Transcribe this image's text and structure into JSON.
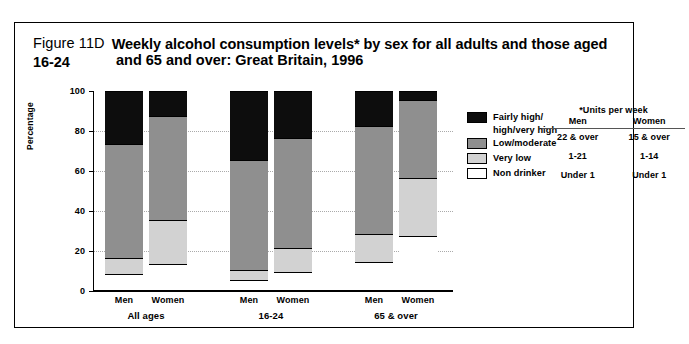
{
  "figure": {
    "number": "Figure 11D",
    "title_line1": "Weekly alcohol consumption levels* by sex for all adults and those aged 16-24",
    "title_line2": "and 65 and over: Great Britain, 1996"
  },
  "legend": {
    "items": [
      {
        "label": "Fairly high/",
        "label2": "high/very high",
        "color": "#0d0d0d",
        "key": "fairly-high"
      },
      {
        "label": "Low/moderate",
        "color": "#8f8f8f",
        "key": "low-moderate"
      },
      {
        "label": "Very low",
        "color": "#d2d2d2",
        "key": "very-low"
      },
      {
        "label": "Non drinker",
        "color": "#ffffff",
        "key": "non-drinker"
      }
    ],
    "units_table": {
      "title": "*Units per week",
      "columns": [
        "Men",
        "Women"
      ],
      "rows": [
        {
          "men": "22 & over",
          "women": "15 & over"
        },
        {
          "men": "1-21",
          "women": "1-14"
        },
        {
          "men": "Under 1",
          "women": "Under 1"
        }
      ]
    }
  },
  "chart_data": {
    "type": "bar",
    "title": "Weekly alcohol consumption levels* by sex for all adults and those aged 16-24 and 65 and over: Great Britain, 1996",
    "xlabel": "",
    "ylabel": "Percentage",
    "ylim": [
      0,
      100
    ],
    "yticks": [
      0,
      20,
      40,
      60,
      80,
      100
    ],
    "grid": true,
    "stacked": true,
    "legend_position": "right",
    "groups": [
      "All ages",
      "16-24",
      "65 & over"
    ],
    "categories": [
      "Men",
      "Women",
      "Men",
      "Women",
      "Men",
      "Women"
    ],
    "series": [
      {
        "name": "Non drinker",
        "color": "#ffffff",
        "values": [
          8,
          13,
          5,
          9,
          14,
          27
        ]
      },
      {
        "name": "Very low",
        "color": "#d2d2d2",
        "values": [
          8,
          22,
          5,
          12,
          14,
          29
        ]
      },
      {
        "name": "Low/moderate",
        "color": "#8f8f8f",
        "values": [
          57,
          52,
          55,
          55,
          54,
          39
        ]
      },
      {
        "name": "Fairly high/high/very high",
        "color": "#0d0d0d",
        "values": [
          27,
          13,
          35,
          24,
          18,
          5
        ]
      }
    ]
  },
  "axis": {
    "y_title": "Percentage",
    "tick_labels": [
      "0",
      "20",
      "40",
      "60",
      "80",
      "100"
    ],
    "group_labels": [
      "All ages",
      "16-24",
      "65 & over"
    ],
    "bar_labels": [
      "Men",
      "Women",
      "Men",
      "Women",
      "Men",
      "Women"
    ]
  }
}
